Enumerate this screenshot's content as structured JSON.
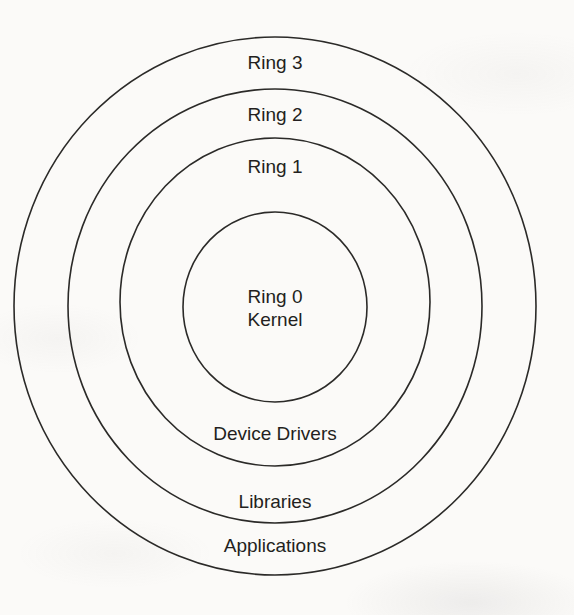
{
  "diagram": {
    "type": "concentric-protection-rings",
    "rings": [
      {
        "id": "ring-0",
        "label": "Ring 0",
        "sublabel": "Kernel"
      },
      {
        "id": "ring-1",
        "label": "Ring 1",
        "content_label": "Device Drivers"
      },
      {
        "id": "ring-2",
        "label": "Ring 2",
        "content_label": "Libraries"
      },
      {
        "id": "ring-3",
        "label": "Ring 3",
        "content_label": "Applications"
      }
    ],
    "colors": {
      "stroke": "#2b2a28",
      "text": "#231f20",
      "background": "#fbfaf8"
    }
  }
}
